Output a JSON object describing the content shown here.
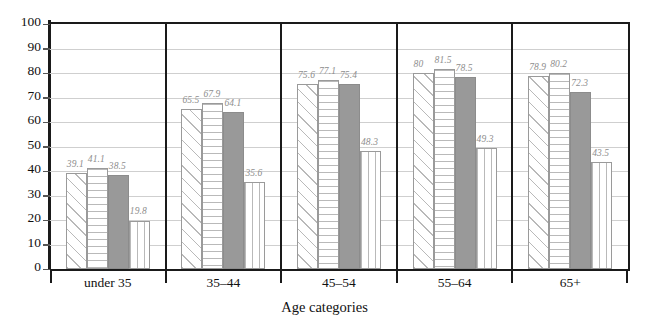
{
  "chart_data": {
    "type": "bar",
    "title": "",
    "subtitle": "",
    "xlabel": "Age categories",
    "ylabel": "",
    "ylim": [
      0,
      100
    ],
    "ytick_interval": 10,
    "yticks": [
      100,
      90,
      80,
      70,
      60,
      50,
      40,
      30,
      20,
      10,
      0
    ],
    "grid": true,
    "legend": "none",
    "categories": [
      "under 35",
      "35–44",
      "45–54",
      "55–64",
      "65+"
    ],
    "series": [
      {
        "name": "series-1",
        "pattern": "diagonal-hatch",
        "values": [
          39.1,
          65.5,
          75.6,
          80,
          78.9
        ],
        "labels": [
          "39.1",
          "65.5",
          "75.6",
          "80",
          "78.9"
        ]
      },
      {
        "name": "series-2",
        "pattern": "horizontal-lines",
        "values": [
          41.1,
          67.9,
          77.1,
          81.5,
          80.2
        ],
        "labels": [
          "41.1",
          "67.9",
          "77.1",
          "81.5",
          "80.2"
        ]
      },
      {
        "name": "series-3",
        "pattern": "solid-gray",
        "values": [
          38.5,
          64.1,
          75.4,
          78.5,
          72.3
        ],
        "labels": [
          "38.5",
          "64.1",
          "75.4",
          "78.5",
          "72.3"
        ]
      },
      {
        "name": "series-4",
        "pattern": "vertical-lines",
        "values": [
          19.8,
          35.6,
          48.3,
          49.3,
          43.5
        ],
        "labels": [
          "19.8",
          "35.6",
          "48.3",
          "49.3",
          "43.5"
        ]
      }
    ],
    "colors": {
      "axis": "#1a1a1a",
      "gridline": "#cfcfcf",
      "data_label": "#8e8e8e",
      "solid_bar": "#999999",
      "pattern_stroke": "#b9b9b9",
      "bar_outline": "#9a9a9a"
    }
  }
}
